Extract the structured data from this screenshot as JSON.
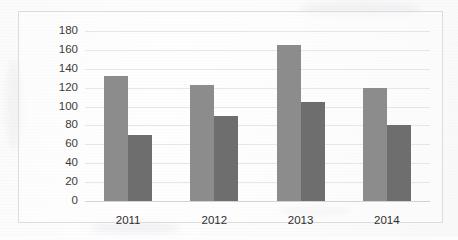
{
  "chart_data": {
    "type": "bar",
    "title": "",
    "subtitle": "",
    "xlabel": "",
    "ylabel": "",
    "categories": [
      "2011",
      "2012",
      "2013",
      "2014"
    ],
    "series": [
      {
        "name": "Series 1",
        "color": "#8c8c8c",
        "values": [
          132,
          123,
          165,
          120
        ]
      },
      {
        "name": "Series 2",
        "color": "#6e6e6e",
        "values": [
          70,
          90,
          105,
          80
        ]
      }
    ],
    "ylim": [
      0,
      180
    ],
    "ytick_step": 20,
    "ytick_labels": [
      "180",
      "160",
      "140",
      "120",
      "100",
      "80",
      "60",
      "40",
      "20",
      "0"
    ],
    "ytick_values": [
      180,
      160,
      140,
      120,
      100,
      80,
      60,
      40,
      20,
      0
    ],
    "grid": true,
    "grid_axis": "y",
    "legend": false,
    "legend_position": "none",
    "annotations": [],
    "bar_grouping": "clustered",
    "background_color": "#fdfdfd",
    "gridline_color": "#e6e6e6",
    "frame_color": "#dcdcdc"
  }
}
